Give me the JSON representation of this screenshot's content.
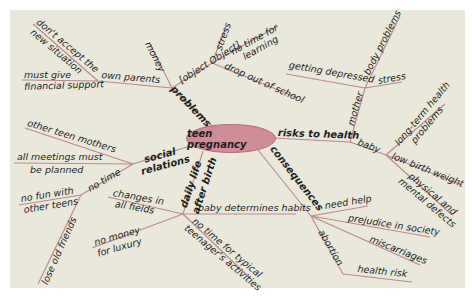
{
  "colors": {
    "background": "#e9e8da",
    "line": "#b9878d",
    "center_fill": "#cf8d96",
    "text": "#1e1e1e"
  },
  "center": {
    "label": "teen pregnancy"
  },
  "branches": {
    "problems": {
      "label": "problems",
      "own_parents": {
        "label": "own parents",
        "children": [
          "don't accept the new situation",
          "must give financial support"
        ],
        "child_lines": [
          "don't accept the",
          "new situation",
          "must give",
          "financial support"
        ]
      },
      "money": "money",
      "school": {
        "label": "school",
        "children": [
          "stress",
          "no time for learning",
          "drop out of school"
        ],
        "child_lines": [
          "stress",
          "no time for",
          "learning",
          "drop out of school"
        ]
      }
    },
    "risks_to_health": {
      "label": "risks to health",
      "mother": {
        "label": "mother",
        "children": [
          "getting depressed",
          "body problems",
          "stress"
        ]
      },
      "baby": {
        "label": "baby",
        "children": [
          "long-term health problems",
          "low birth weight",
          "physical and mental defects"
        ],
        "child_lines": [
          "long-term health",
          "problems",
          "low birth weight",
          "physical and",
          "mental defects"
        ]
      }
    },
    "consequences": {
      "label": "consequences",
      "children": [
        "need help",
        "prejudice in society",
        "miscarriages",
        "abortion",
        "health risk"
      ]
    },
    "daily_life": {
      "label": "daily life after birth",
      "label_lines": [
        "daily life",
        "after birth"
      ],
      "children": [
        "changes in all fields",
        "baby determines habits",
        "no money for luxury",
        "no time for typical teenager's activities"
      ],
      "child_lines": [
        "changes in",
        "all fields",
        "baby determines habits",
        "no money",
        "for luxury",
        "no time for typical",
        "teenager's activities"
      ]
    },
    "social_relations": {
      "label": "social relations",
      "label_lines": [
        "social",
        "relations"
      ],
      "children": [
        "other teen mothers",
        "all meetings must be planned",
        "no time"
      ],
      "child_lines": [
        "other teen mothers",
        "all meetings must",
        "be planned",
        "no time"
      ],
      "no_time": {
        "label": "no time",
        "children": [
          "no fun with other teens",
          "lose old friends"
        ],
        "child_lines": [
          "no fun with",
          "other teens",
          "lose old friends"
        ]
      }
    }
  }
}
